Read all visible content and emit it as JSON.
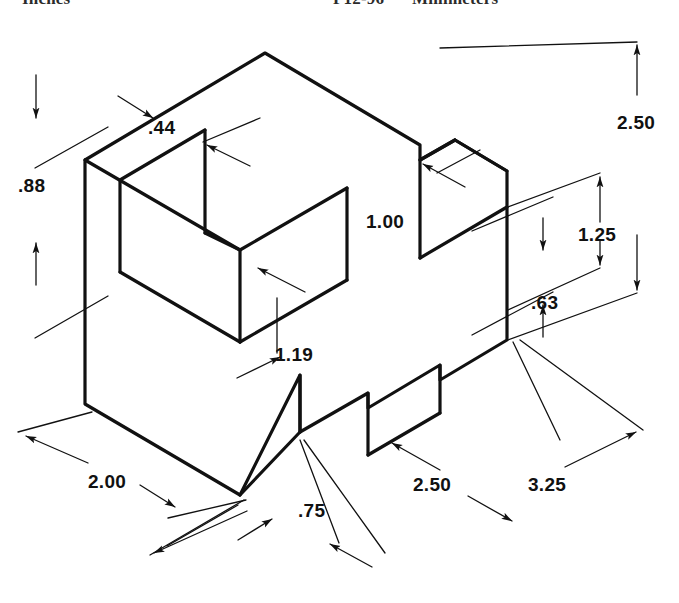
{
  "page": {
    "width": 679,
    "height": 603,
    "background": "#ffffff",
    "line_color": "#111111"
  },
  "header": {
    "units_left": "Inches",
    "figure_code": "P12-96",
    "units_right": "Millimeters"
  },
  "drawing": {
    "type": "isometric-orthographic-dimensioned-solid",
    "object_description": "Isometric pictorial of a machined block with a rectangular pocket in the top-left, a through slot on the right face and a step notch at the lower front",
    "projection": "isometric",
    "object_line_weight_px": 3.2,
    "dimension_line_weight_px": 1.3
  },
  "dimensions": [
    {
      "id": "d-088",
      "value": ".88",
      "x": 18,
      "y": 175,
      "orientation": "vertical",
      "description": "height of upper-left wall / pocket floor thickness"
    },
    {
      "id": "d-044",
      "value": ".44",
      "x": 148,
      "y": 117,
      "orientation": "iso-right",
      "description": "wall thickness at top-left rear"
    },
    {
      "id": "d-100",
      "value": "1.00",
      "x": 366,
      "y": 211,
      "orientation": "iso-right",
      "description": "width of the right-hand vertical slot"
    },
    {
      "id": "d-119",
      "value": "1.19",
      "x": 275,
      "y": 344,
      "orientation": "iso-left",
      "description": "depth of pocket measured along the left iso axis"
    },
    {
      "id": "d-250a",
      "value": "2.50",
      "x": 617,
      "y": 112,
      "orientation": "vertical",
      "description": "overall height of the block"
    },
    {
      "id": "d-125",
      "value": "1.25",
      "x": 578,
      "y": 224,
      "orientation": "vertical",
      "description": "height to top of the right slot"
    },
    {
      "id": "d-063",
      "value": ".63",
      "x": 531,
      "y": 292,
      "orientation": "vertical",
      "description": "height of the right slot opening"
    },
    {
      "id": "d-200",
      "value": "2.00",
      "x": 88,
      "y": 471,
      "orientation": "iso-left",
      "description": "overall depth along the left iso axis"
    },
    {
      "id": "d-075",
      "value": ".75",
      "x": 298,
      "y": 500,
      "orientation": "iso-right",
      "description": "width of the front step notch"
    },
    {
      "id": "d-250b",
      "value": "2.50",
      "x": 413,
      "y": 474,
      "orientation": "iso-right",
      "description": "length from notch to right end"
    },
    {
      "id": "d-325",
      "value": "3.25",
      "x": 528,
      "y": 474,
      "orientation": "iso-right",
      "description": "overall length along the right iso axis"
    }
  ]
}
